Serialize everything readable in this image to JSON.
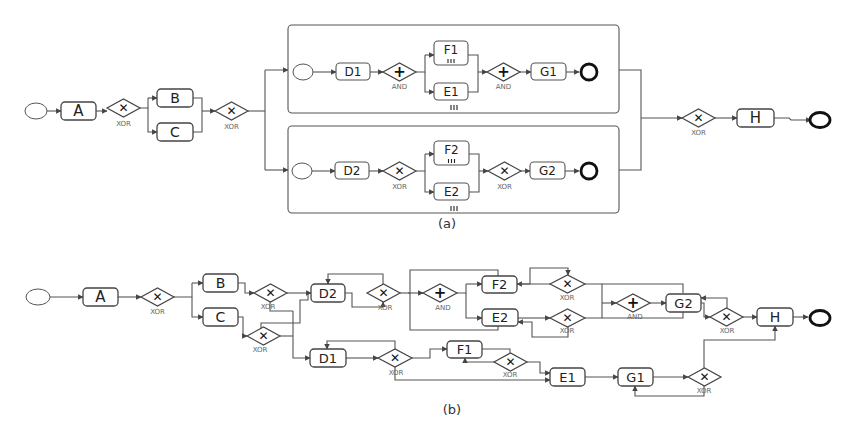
{
  "diagram_a": {
    "caption": "(a)",
    "tasks": {
      "A": "A",
      "B": "B",
      "C": "C",
      "D1": "D1",
      "F1": "F1",
      "E1": "E1",
      "G1": "G1",
      "D2": "D2",
      "F2": "F2",
      "E2": "E2",
      "G2": "G2",
      "H": "H"
    },
    "gateways": {
      "xor": "XOR",
      "and": "AND",
      "xor_symbol": "✕",
      "and_symbol": "+"
    },
    "multi_instance_marker": "|||"
  },
  "diagram_b": {
    "caption": "(b)",
    "tasks": {
      "A": "A",
      "B": "B",
      "C": "C",
      "D1": "D1",
      "D2": "D2",
      "F1": "F1",
      "E1": "E1",
      "F2": "F2",
      "E2": "E2",
      "G1": "G1",
      "G2": "G2",
      "H": "H"
    },
    "gateways": {
      "xor": "XOR",
      "and": "AND",
      "xor_symbol": "✕",
      "and_symbol": "+"
    }
  }
}
